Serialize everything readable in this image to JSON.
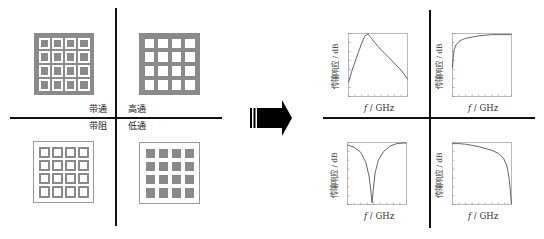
{
  "left_panel": {
    "quadrants": [
      {
        "id": "bandpass",
        "label": "带通",
        "pattern": "gray-field-white-ring-gray-patch",
        "grid": [
          4,
          4
        ]
      },
      {
        "id": "highpass",
        "label": "高通",
        "pattern": "gray-field-white-apertures",
        "grid": [
          4,
          4
        ]
      },
      {
        "id": "bandstop",
        "label": "带阻",
        "pattern": "white-field-gray-rings",
        "grid": [
          4,
          4
        ]
      },
      {
        "id": "lowpass",
        "label": "低通",
        "pattern": "white-field-gray-patches",
        "grid": [
          4,
          4
        ]
      }
    ]
  },
  "arrow": {
    "direction": "right",
    "icon": "block-arrow-right-icon"
  },
  "right_panel": {
    "charts": [
      {
        "id": "bandpass-response",
        "ylabel": "传输响应 / dB",
        "xlabel_var": "f",
        "xlabel_unit": " / GHz",
        "shape": "bandpass"
      },
      {
        "id": "highpass-response",
        "ylabel": "传输响应 / dB",
        "xlabel_var": "f",
        "xlabel_unit": " / GHz",
        "shape": "highpass"
      },
      {
        "id": "bandstop-response",
        "ylabel": "传输响应 / dB",
        "xlabel_var": "f",
        "xlabel_unit": " / GHz",
        "shape": "bandstop"
      },
      {
        "id": "lowpass-response",
        "ylabel": "传输响应 / dB",
        "xlabel_var": "f",
        "xlabel_unit": " / GHz",
        "shape": "lowpass"
      }
    ]
  },
  "colors": {
    "gray": "#8a8a8a",
    "line": "#111111",
    "curve": "#555555",
    "frame": "#aaaaaa"
  },
  "chart_data": [
    {
      "type": "line",
      "title": "带通",
      "xlabel": "f / GHz",
      "ylabel": "传输响应 / dB",
      "x": [
        0,
        0.5,
        1,
        1.5,
        2,
        2.5,
        3,
        3.5,
        4,
        4.5,
        5,
        5.5,
        6,
        6.5,
        7,
        7.5,
        8,
        8.5,
        9
      ],
      "values": [
        0.22,
        0.4,
        0.55,
        0.7,
        0.85,
        0.97,
        1.0,
        0.93,
        0.86,
        0.8,
        0.74,
        0.69,
        0.64,
        0.58,
        0.53,
        0.47,
        0.42,
        0.35,
        0.27
      ],
      "ylim": [
        0,
        1
      ],
      "grid": false
    },
    {
      "type": "line",
      "title": "高通",
      "xlabel": "f / GHz",
      "ylabel": "传输响应 / dB",
      "x": [
        0,
        0.1,
        0.25,
        0.5,
        1,
        1.5,
        2,
        3,
        4,
        5,
        6,
        7,
        8,
        9
      ],
      "values": [
        0.45,
        0.62,
        0.74,
        0.82,
        0.88,
        0.91,
        0.93,
        0.95,
        0.97,
        0.98,
        0.99,
        0.99,
        0.99,
        0.99
      ],
      "ylim": [
        0,
        1
      ],
      "grid": false
    },
    {
      "type": "line",
      "title": "带阻",
      "xlabel": "f / GHz",
      "ylabel": "传输响应 / dB",
      "x": [
        0,
        1,
        2,
        2.8,
        3.3,
        3.6,
        3.75,
        3.9,
        4.2,
        4.7,
        5.5,
        6.5,
        7.5,
        8.5,
        9
      ],
      "values": [
        0.97,
        0.93,
        0.85,
        0.68,
        0.45,
        0.18,
        0.02,
        0.2,
        0.5,
        0.72,
        0.86,
        0.95,
        0.99,
        1.0,
        1.0
      ],
      "ylim": [
        0,
        1
      ],
      "grid": false
    },
    {
      "type": "line",
      "title": "低通",
      "xlabel": "f / GHz",
      "ylabel": "传输响应 / dB",
      "x": [
        0,
        1,
        2,
        3,
        4,
        5,
        6,
        7,
        7.8,
        8.3,
        8.6,
        8.8,
        8.9,
        9
      ],
      "values": [
        0.99,
        0.99,
        0.98,
        0.96,
        0.94,
        0.91,
        0.88,
        0.83,
        0.75,
        0.62,
        0.45,
        0.25,
        0.1,
        0.0
      ],
      "ylim": [
        0,
        1
      ],
      "grid": false
    }
  ]
}
